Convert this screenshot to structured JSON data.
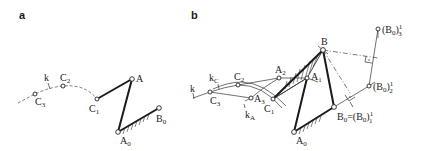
{
  "panels": [
    {
      "id": "a",
      "label": "a",
      "points": {
        "C3": {
          "name": "C",
          "sub": "3"
        },
        "C2": {
          "name": "C",
          "sub": "2"
        },
        "C1": {
          "name": "C",
          "sub": "1"
        },
        "A": {
          "name": "A",
          "sub": ""
        },
        "A0": {
          "name": "A",
          "sub": "0"
        },
        "B0": {
          "name": "B",
          "sub": "0"
        }
      },
      "curve_label": "k"
    },
    {
      "id": "b",
      "label": "b",
      "points": {
        "B": {
          "name": "B",
          "sub": ""
        },
        "A1": {
          "name": "A",
          "sub": "1"
        },
        "A2": {
          "name": "A",
          "sub": "2"
        },
        "A3": {
          "name": "A",
          "sub": "3"
        },
        "C1": {
          "name": "C",
          "sub": "1"
        },
        "C2": {
          "name": "C",
          "sub": "2"
        },
        "C3": {
          "name": "C",
          "sub": "3"
        },
        "A0": {
          "name": "A",
          "sub": "0"
        },
        "B0": {
          "name": "B",
          "sub": "0",
          "suffix": "=(B",
          "suffix_sub": "0",
          "suffix_close": ")",
          "sup": "1",
          "sup_sub": "1"
        },
        "B0_2": {
          "name": "(B",
          "sub": "0",
          "close": ")",
          "sup": "1",
          "sup_sub": "2"
        },
        "B0_3": {
          "name": "(B",
          "sub": "0",
          "close": ")",
          "sup": "1",
          "sup_sub": "3"
        }
      },
      "curve_labels": {
        "k": "k",
        "kC": {
          "name": "k",
          "sub": "C"
        },
        "kA": {
          "name": "k",
          "sub": "A"
        }
      }
    }
  ]
}
